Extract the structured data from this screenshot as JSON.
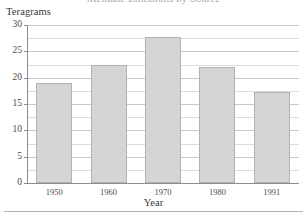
{
  "figure": {
    "title_remnant": "Methane Emissions by Source",
    "bottom_rule": "horizontal-rule"
  },
  "chart_data": {
    "type": "bar",
    "title": "",
    "xlabel": "Year",
    "ylabel": "Teragrams",
    "categories": [
      "1950",
      "1960",
      "1970",
      "1980",
      "1991"
    ],
    "values": [
      19,
      22.5,
      27.8,
      22,
      17.3
    ],
    "ylim": [
      0,
      30
    ],
    "ytick_labels": [
      "0",
      "5",
      "10",
      "15",
      "20",
      "25",
      "30"
    ],
    "ytick_values": [
      0,
      5,
      10,
      15,
      20,
      25,
      30
    ],
    "minor_gridline_values": [
      2.5,
      7.5,
      12.5,
      17.5,
      22.5,
      27.5
    ],
    "grid": "horizontal",
    "legend": "none",
    "bar_color": "#d5d5d5",
    "bar_border_color": "#b2b2b2",
    "gridline_color": "#c9c9cb",
    "axis_color": "#8d8d90"
  }
}
